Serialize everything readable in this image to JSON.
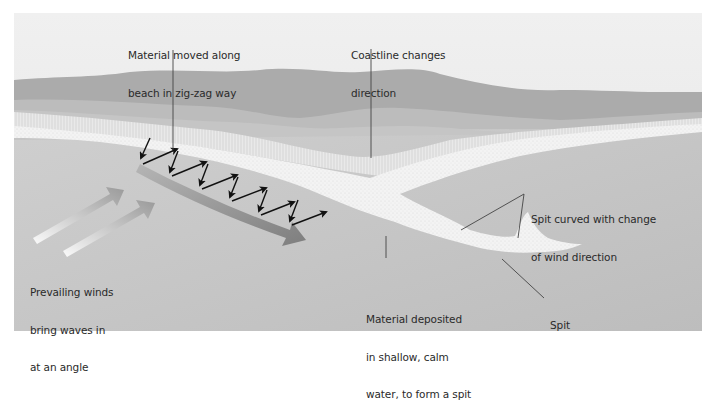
{
  "diagram": {
    "colors": {
      "sky": "#ececec",
      "hills_far": "#a9a9a9",
      "hills_mid": "#bdbdbd",
      "hills_near": "#c6c6c6",
      "sea": "#c4c4c4",
      "beach": "#f2f2f2",
      "drift_arrow": "#8a8a8a",
      "zigzag_arrows": "#111111",
      "leader_lines": "#444444",
      "text": "#2a2a2a"
    },
    "labels": {
      "zigzag": {
        "line1": "Material moved along",
        "line2": "beach in zig-zag way"
      },
      "coastline": {
        "line1": "Coastline changes",
        "line2": "direction"
      },
      "winds": {
        "line1": "Prevailing winds",
        "line2": "bring waves in",
        "line3": "at an angle"
      },
      "deposited": {
        "line1": "Material deposited",
        "line2": "in shallow, calm",
        "line3": "water, to form a spit"
      },
      "curved": {
        "line1": "Spit curved with change",
        "line2": "of wind direction"
      },
      "spit": {
        "line1": "Spit"
      }
    },
    "icons": {
      "wind_arrows": "two-diagonal-gradient-arrows",
      "longshore_drift_arrow": "curved-grey-arrow",
      "swash_backwash": "zigzag-black-arrows"
    }
  }
}
